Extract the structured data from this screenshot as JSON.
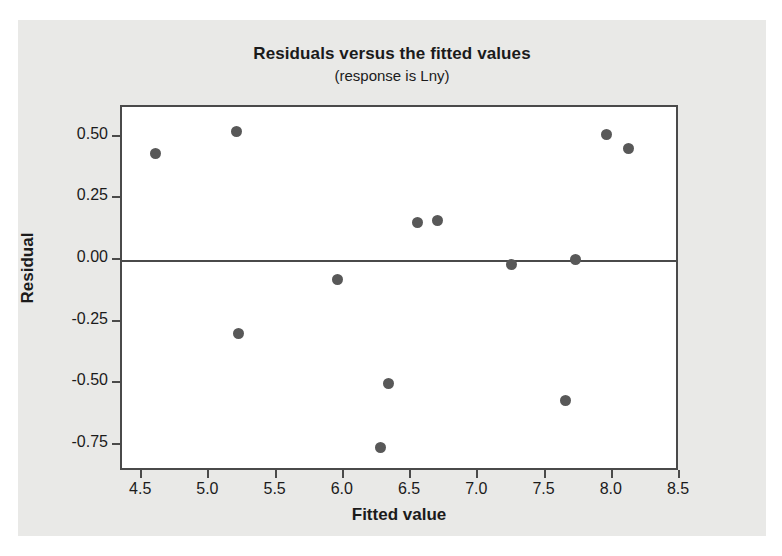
{
  "chart_data": {
    "type": "scatter",
    "title": "Residuals versus the fitted values",
    "subtitle": "(response is Lny)",
    "xlabel": "Fitted value",
    "ylabel": "Residual",
    "xlim": [
      4.35,
      8.5
    ],
    "ylim": [
      -0.86,
      0.62
    ],
    "grid": false,
    "legend": null,
    "reference_line": {
      "orientation": "horizontal",
      "value": 0.0
    },
    "xticks": [
      4.5,
      5.0,
      5.5,
      6.0,
      6.5,
      7.0,
      7.5,
      8.0,
      8.5
    ],
    "xticklabels": [
      "4.5",
      "5.0",
      "5.5",
      "6.0",
      "6.5",
      "7.0",
      "7.5",
      "8.0",
      "8.5"
    ],
    "yticks": [
      0.5,
      0.25,
      0.0,
      -0.25,
      -0.5,
      -0.75
    ],
    "yticklabels": [
      "0.50",
      "0.25",
      "0.00",
      "-0.25",
      "-0.50",
      "-0.75"
    ],
    "marker_color": "#585858",
    "points": [
      {
        "x": 4.6,
        "y": 0.43
      },
      {
        "x": 5.2,
        "y": 0.52
      },
      {
        "x": 5.22,
        "y": -0.3
      },
      {
        "x": 5.95,
        "y": -0.08
      },
      {
        "x": 6.27,
        "y": -0.76
      },
      {
        "x": 6.33,
        "y": -0.5
      },
      {
        "x": 6.55,
        "y": 0.15
      },
      {
        "x": 6.7,
        "y": 0.16
      },
      {
        "x": 7.25,
        "y": -0.02
      },
      {
        "x": 7.65,
        "y": -0.57
      },
      {
        "x": 7.72,
        "y": 0.0
      },
      {
        "x": 7.95,
        "y": 0.51
      },
      {
        "x": 8.12,
        "y": 0.45
      }
    ]
  }
}
